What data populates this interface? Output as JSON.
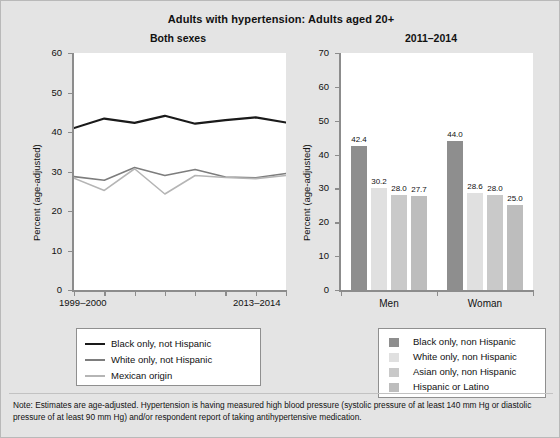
{
  "header": {
    "main_title": "Adults with hypertension: Adults aged 20+"
  },
  "left_panel": {
    "title": "Both sexes",
    "y_axis_title": "Percent (age-adjusted)",
    "y_ticks": [
      "0",
      "10",
      "20",
      "30",
      "40",
      "50",
      "60"
    ],
    "x_label_start": "1999–2000",
    "x_label_end": "2013–2014",
    "legend": [
      {
        "label": "Black only, not Hispanic",
        "color": "#1a1a1a"
      },
      {
        "label": "White only, not Hispanic",
        "color": "#7d7d7d"
      },
      {
        "label": "Mexican origin",
        "color": "#b5b5b5"
      }
    ]
  },
  "right_panel": {
    "title": "2011–2014",
    "y_axis_title": "Percent (age-adjusted)",
    "y_ticks": [
      "0",
      "10",
      "20",
      "30",
      "40",
      "50",
      "60",
      "70"
    ],
    "group_labels": [
      "Men",
      "Woman"
    ],
    "legend": [
      {
        "label": "Black only, non Hispanic",
        "color": "#8e8e8e"
      },
      {
        "label": "White only, non Hispanic",
        "color": "#e0e0e0"
      },
      {
        "label": "Asian only, non Hispanic",
        "color": "#c9c9c9"
      },
      {
        "label": "Hispanic or Latino",
        "color": "#bdbdbd"
      }
    ]
  },
  "footnote": {
    "text": "Note: Estimates are age-adjusted. Hypertension is having measured high blood pressure (systolic pressure of at least 140 mm Hg or diastolic pressure of at least 90 mm Hg) and/or respondent report of taking antihypertensive medication."
  },
  "chart_data": [
    {
      "type": "line",
      "id": "left-line-chart",
      "title": "Both sexes",
      "subtitle": "Adults with hypertension: Adults aged 20+",
      "xlabel": "",
      "ylabel": "Percent (age-adjusted)",
      "ylim": [
        0,
        60
      ],
      "yticks": [
        0,
        10,
        20,
        30,
        40,
        50,
        60
      ],
      "grid": false,
      "legend_position": "below",
      "categories": [
        "1999–2000",
        "2001–2002",
        "2003–2004",
        "2005–2006",
        "2007–2008",
        "2009–2010",
        "2011–2012",
        "2013–2014"
      ],
      "xtick_labels_shown": [
        "1999–2000",
        "2013–2014"
      ],
      "series": [
        {
          "name": "Black only, not Hispanic",
          "color": "#1a1a1a",
          "values": [
            41.0,
            43.4,
            42.3,
            44.1,
            42.1,
            43.0,
            43.7,
            42.4
          ]
        },
        {
          "name": "White only, not Hispanic",
          "color": "#7d7d7d",
          "values": [
            28.7,
            27.8,
            31.0,
            29.0,
            30.5,
            28.6,
            28.4,
            29.5
          ]
        },
        {
          "name": "Mexican origin",
          "color": "#b5b5b5",
          "values": [
            28.3,
            25.2,
            30.7,
            24.3,
            29.0,
            28.5,
            28.2,
            29.0
          ]
        }
      ]
    },
    {
      "type": "bar",
      "id": "right-bar-chart",
      "title": "2011–2014",
      "subtitle": "Adults with hypertension: Adults aged 20+",
      "xlabel": "",
      "ylabel": "Percent (age-adjusted)",
      "ylim": [
        0,
        70
      ],
      "yticks": [
        0,
        10,
        20,
        30,
        40,
        50,
        60,
        70
      ],
      "grid": false,
      "legend_position": "below",
      "categories": [
        "Men",
        "Woman"
      ],
      "series": [
        {
          "name": "Black only, non Hispanic",
          "color": "#8e8e8e",
          "values": [
            42.4,
            44.0
          ]
        },
        {
          "name": "White only, non Hispanic",
          "color": "#e0e0e0",
          "values": [
            30.2,
            28.6
          ]
        },
        {
          "name": "Asian only, non Hispanic",
          "color": "#c9c9c9",
          "values": [
            28.0,
            28.0
          ]
        },
        {
          "name": "Hispanic or Latino",
          "color": "#bdbdbd",
          "values": [
            27.7,
            25.0
          ]
        }
      ],
      "data_labels": [
        [
          "42.4",
          "30.2",
          "28.0",
          "27.7"
        ],
        [
          "44.0",
          "28.6",
          "28.0",
          "25.0"
        ]
      ]
    }
  ]
}
